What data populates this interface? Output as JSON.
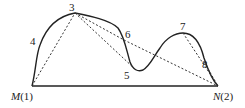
{
  "diagram": {
    "title": "",
    "colors": {
      "stroke": "#222222",
      "background": "#ffffff"
    },
    "labels": {
      "m": "M",
      "m_idx": "(1)",
      "n": "N",
      "n_idx": "(2)",
      "p3": "3",
      "p4": "4",
      "p5": "5",
      "p6": "6",
      "p7": "7",
      "p8": "8"
    },
    "points": {
      "M": [
        32,
        86
      ],
      "N": [
        218,
        86
      ],
      "3": [
        75,
        13
      ],
      "4": [
        40,
        50
      ],
      "5": [
        136,
        70
      ],
      "6": [
        124,
        40
      ],
      "7": [
        183,
        33
      ],
      "8": [
        204,
        62
      ]
    },
    "dashed_edges": [
      [
        "M",
        "3"
      ],
      [
        "3",
        "6"
      ],
      [
        "3",
        "5"
      ],
      [
        "6",
        "N"
      ],
      [
        "7",
        "N"
      ],
      [
        "8",
        "N"
      ]
    ],
    "solid_edges": [
      [
        "M",
        "N"
      ]
    ]
  }
}
